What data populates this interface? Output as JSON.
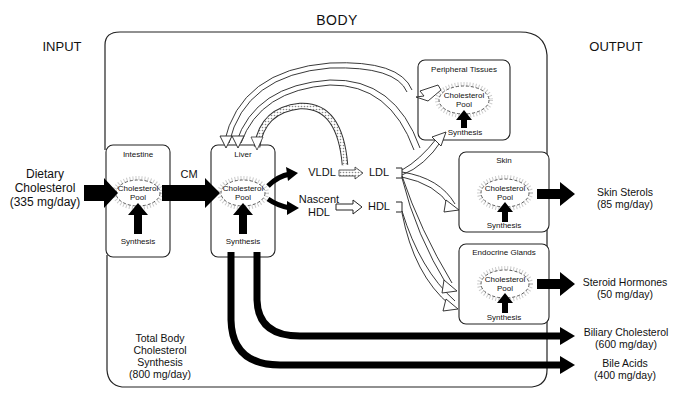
{
  "headers": {
    "body": "BODY",
    "input": "INPUT",
    "output": "OUTPUT"
  },
  "input": {
    "label": "Dietary\nCholesterol\n(335 mg/day)"
  },
  "flows": {
    "cm": "CM",
    "vldl": "VLDL",
    "ldl": "LDL",
    "nascent_hdl": "Nascent\nHDL",
    "hdl": "HDL"
  },
  "organs": [
    {
      "id": "intestine",
      "title": "Intestine",
      "pool": "Cholesterol\nPool",
      "synthesis": "Synthesis"
    },
    {
      "id": "liver",
      "title": "Liver",
      "pool": "Cholesterol\nPool",
      "synthesis": "Synthesis"
    },
    {
      "id": "peripheral",
      "title": "Peripheral Tissues",
      "pool": "Cholesterol\nPool",
      "synthesis": "Synthesis"
    },
    {
      "id": "skin",
      "title": "Skin",
      "pool": "Cholesterol\nPool",
      "synthesis": "Synthesis"
    },
    {
      "id": "endocrine",
      "title": "Endocrine Glands",
      "pool": "Cholesterol\nPool",
      "synthesis": "Synthesis"
    }
  ],
  "outputs": [
    {
      "label": "Skin Sterols\n(85 mg/day)"
    },
    {
      "label": "Steroid Hormones\n(50 mg/day)"
    },
    {
      "label": "Biliary Cholesterol\n(600 mg/day)"
    },
    {
      "label": "Bile Acids\n(400 mg/day)"
    }
  ],
  "total_synthesis": "Total Body\nCholesterol\nSynthesis\n(800 mg/day)"
}
